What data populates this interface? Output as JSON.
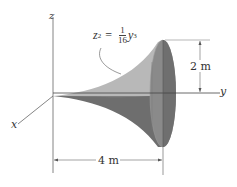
{
  "figure": {
    "axes": {
      "z_label": "z",
      "y_label": "y",
      "x_label": "x"
    },
    "equation": {
      "lhs_var": "z",
      "lhs_exp": "2",
      "equals": "=",
      "frac_num": "1",
      "frac_den": "16",
      "rhs_var": "y",
      "rhs_exp": "3"
    },
    "dimensions": {
      "radius_label": "2 m",
      "length_label": "4 m"
    },
    "colors": {
      "upper_surface": "#b8b8b8",
      "lower_surface": "#6e6e6e",
      "end_face": "#8a8a8a",
      "end_face_dark": "#707070",
      "lines": "#555555"
    }
  }
}
